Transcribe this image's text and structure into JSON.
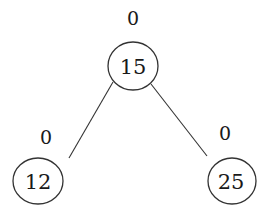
{
  "diagram": {
    "type": "binary-tree",
    "nodes": [
      {
        "id": "root",
        "value": "15",
        "balance_factor": "0"
      },
      {
        "id": "left",
        "value": "12",
        "balance_factor": "0"
      },
      {
        "id": "right",
        "value": "25",
        "balance_factor": "0"
      }
    ],
    "edges": [
      {
        "from": "root",
        "to": "left"
      },
      {
        "from": "root",
        "to": "right"
      }
    ]
  }
}
